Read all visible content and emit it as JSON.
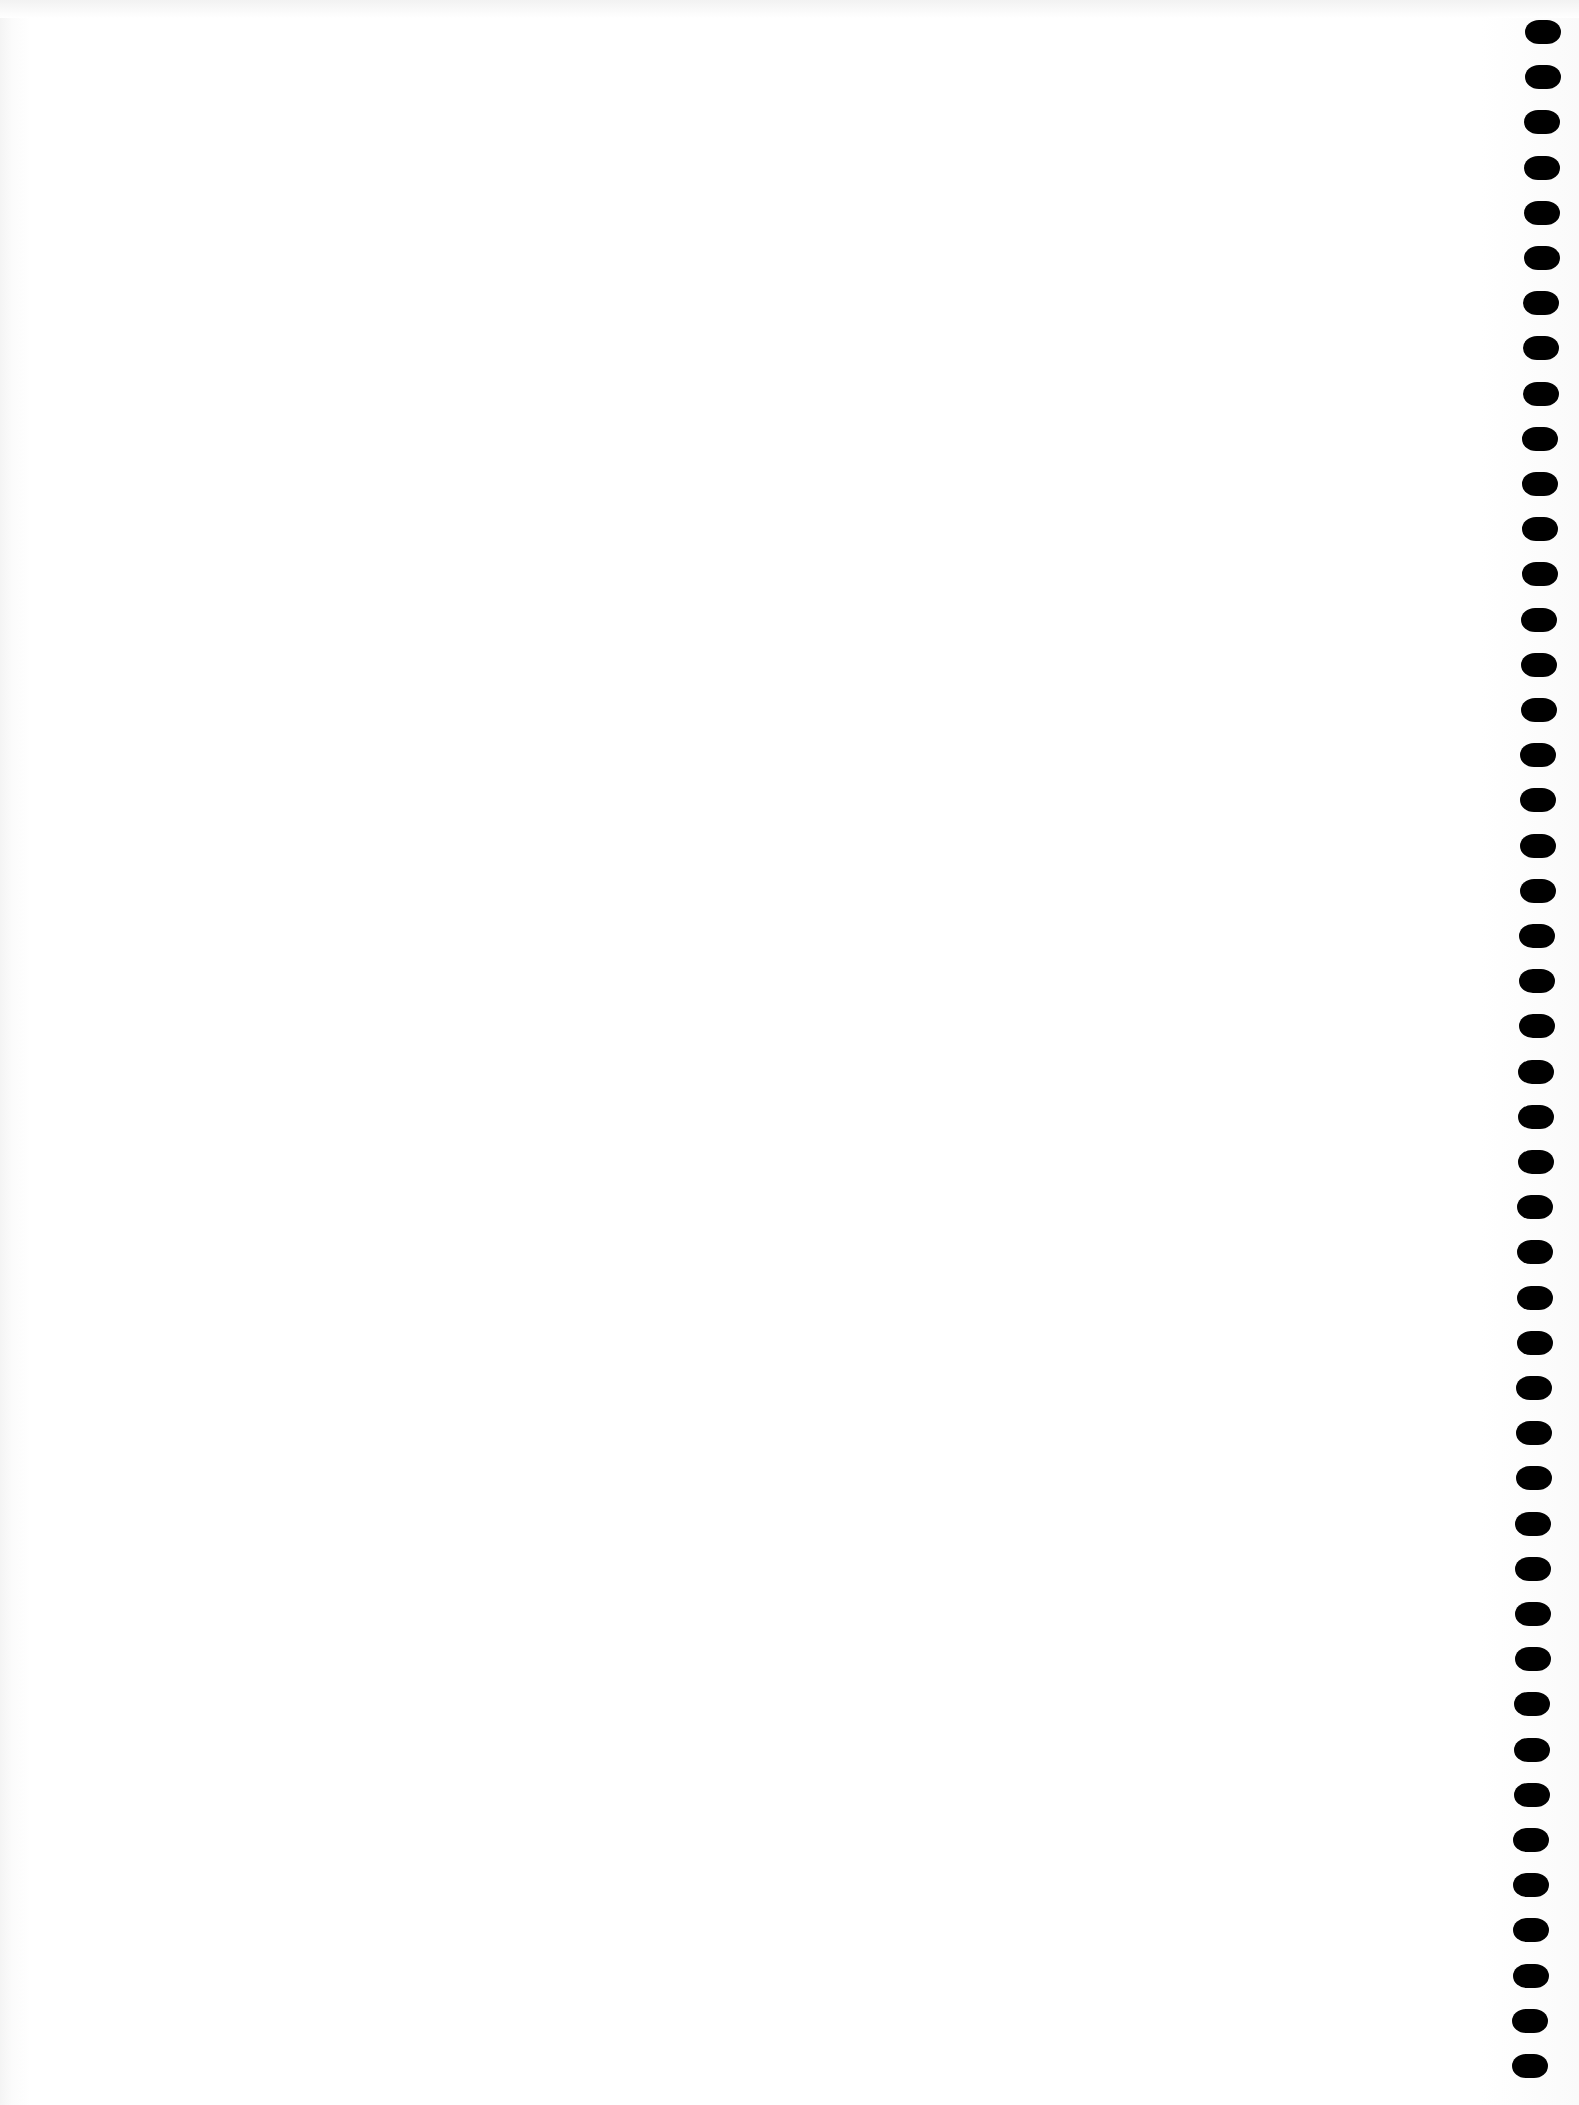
{
  "page": {
    "type": "blank-notebook-page",
    "background_color": "#ffffff",
    "text_content": ""
  },
  "binding": {
    "side": "right",
    "hole_count": 46,
    "hole_color": "#000000",
    "first_hole_y": 20,
    "spacing_px": 45.2,
    "x_top": 1525,
    "x_bottom": 1512
  }
}
